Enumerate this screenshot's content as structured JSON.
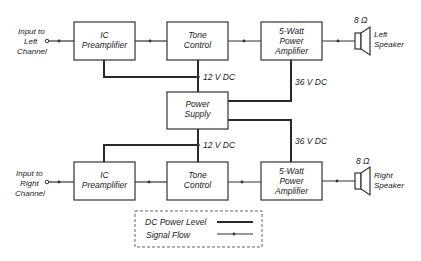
{
  "diagram": {
    "left_channel": {
      "input_label": [
        "Input to",
        "Left",
        "Channel"
      ],
      "preamp": [
        "IC",
        "Preamplifier"
      ],
      "tone": [
        "Tone",
        "Control"
      ],
      "amp": [
        "5-Watt",
        "Power",
        "Amplifier"
      ],
      "impedance": "8 Ω",
      "speaker": [
        "Left",
        "Speaker"
      ]
    },
    "right_channel": {
      "input_label": [
        "Input to",
        "Right",
        "Channel"
      ],
      "preamp": [
        "IC",
        "Preamplifier"
      ],
      "tone": [
        "Tone",
        "Control"
      ],
      "amp": [
        "5-Watt",
        "Power",
        "Amplifier"
      ],
      "impedance": "8 Ω",
      "speaker": [
        "Right",
        "Speaker"
      ]
    },
    "power_supply": [
      "Power",
      "Supply"
    ],
    "voltages": {
      "top_12v": "12 V DC",
      "bottom_12v": "12 V DC",
      "top_36v": "36 V DC",
      "bottom_36v": "36 V DC"
    },
    "legend": {
      "dc_power": "DC Power Level",
      "signal_flow": "Signal Flow"
    },
    "colors": {
      "line": "#2a2a2a",
      "background": "#ffffff"
    }
  }
}
